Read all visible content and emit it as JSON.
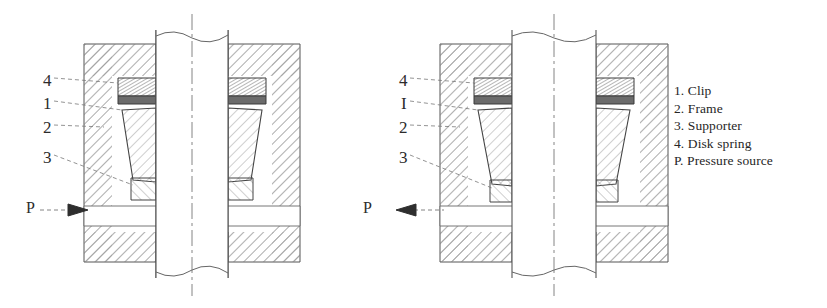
{
  "figure": {
    "title_none": "",
    "background": "#ffffff",
    "line_color": "#4a4a4a",
    "hatch_color": "#8a8a8a",
    "text_color": "#2b2b2b"
  },
  "legend": {
    "items": [
      "1. Clip",
      "2. Frame",
      "3. Supporter",
      "4. Disk spring",
      "P. Pressure source"
    ]
  },
  "left_view": {
    "state": "clamped",
    "callouts": [
      {
        "text": "4",
        "x": 43,
        "y": 72
      },
      {
        "text": "1",
        "x": 43,
        "y": 95
      },
      {
        "text": "2",
        "x": 43,
        "y": 119
      },
      {
        "text": "3",
        "x": 43,
        "y": 149
      }
    ],
    "pressure": {
      "text": "P",
      "x": 26,
      "y": 200,
      "arrow": "right"
    }
  },
  "right_view": {
    "state": "released",
    "callouts": [
      {
        "text": "4",
        "x": 399,
        "y": 72
      },
      {
        "text": "I",
        "x": 399,
        "y": 95
      },
      {
        "text": "2",
        "x": 399,
        "y": 119
      },
      {
        "text": "3",
        "x": 399,
        "y": 149
      }
    ],
    "pressure": {
      "text": "P",
      "x": 363,
      "y": 200,
      "arrow": "left"
    }
  }
}
